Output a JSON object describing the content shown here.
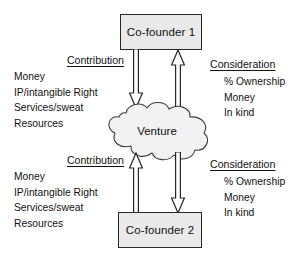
{
  "diagram": {
    "colors": {
      "background": "#ffffff",
      "box_fill": "#e9e9e9",
      "cloud_fill": "#f2f2f2",
      "stroke": "#262626",
      "text": "#111111"
    },
    "nodes": {
      "founder_1": {
        "label": "Co-founder 1",
        "shape": "rectangle"
      },
      "founder_2": {
        "label": "Co-founder 2",
        "shape": "rectangle"
      },
      "venture": {
        "label": "Venture",
        "shape": "cloud"
      }
    },
    "arrows": [
      {
        "name": "contribution-top",
        "from": "Co-founder 1",
        "to": "Venture",
        "direction": "down"
      },
      {
        "name": "consideration-top",
        "from": "Venture",
        "to": "Co-founder 1",
        "direction": "up"
      },
      {
        "name": "contribution-bottom",
        "from": "Co-founder 2",
        "to": "Venture",
        "direction": "up"
      },
      {
        "name": "consideration-bottom",
        "from": "Venture",
        "to": "Co-founder 2",
        "direction": "down"
      }
    ],
    "blocks": {
      "contribution_top": {
        "heading": "Contribution",
        "items": [
          "Money",
          "IP/intangible Right",
          "Services/sweat",
          "Resources"
        ]
      },
      "consideration_top": {
        "heading": "Consideration",
        "items": [
          "% Ownership",
          "Money",
          "In kind"
        ]
      },
      "contribution_bottom": {
        "heading": "Contribution",
        "items": [
          "Money",
          "IP/intangible Right",
          "Services/sweat",
          "Resources"
        ]
      },
      "consideration_bottom": {
        "heading": "Consideration",
        "items": [
          "% Ownership",
          "Money",
          "In kind"
        ]
      }
    }
  }
}
